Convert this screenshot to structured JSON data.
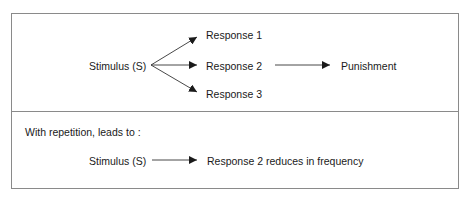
{
  "top_panel": {
    "stimulus": "Stimulus (S)",
    "responses": [
      "Response 1",
      "Response 2",
      "Response 3"
    ],
    "consequence": "Punishment"
  },
  "bottom_panel": {
    "caption": "With repetition, leads to :",
    "stimulus": "Stimulus (S)",
    "outcome": "Response 2 reduces in frequency"
  },
  "colors": {
    "border": "#8a8a8a",
    "arrow": "#1a1a1a",
    "text": "#1a1a1a"
  }
}
